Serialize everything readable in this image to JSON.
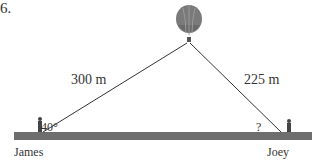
{
  "problem_number": "6.",
  "labels": {
    "left_distance": "300 m",
    "right_distance": "225 m",
    "left_angle": "40°",
    "right_angle": "?",
    "left_person": "James",
    "right_person": "Joey"
  },
  "colors": {
    "ground": "#6e6e6e",
    "line": "#333333",
    "balloon": "#777777"
  }
}
